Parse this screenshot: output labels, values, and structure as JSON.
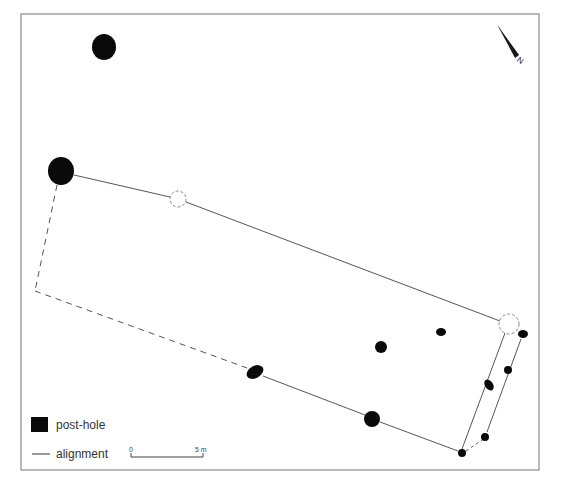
{
  "figure": {
    "type": "archaeological site plan",
    "frame": {
      "x": 21,
      "y": 14,
      "width": 518,
      "height": 456
    }
  },
  "legend": {
    "items": [
      {
        "symbol": "filled-black-square",
        "label": "post-hole"
      },
      {
        "symbol": "solid-line",
        "label": "alignment"
      }
    ]
  },
  "scale_bar": {
    "start_label": "0",
    "end_label": "5 m",
    "length_px": 68
  },
  "north_arrow": {
    "label": "N",
    "orientation_deg": -35
  },
  "colors": {
    "post_hole": "#0a0a0a",
    "alignment": "#555555",
    "frame": "#8a8a8a",
    "background": "#ffffff"
  },
  "features": {
    "post_holes": [
      {
        "id": "ph-top",
        "cx": 104,
        "cy": 47,
        "rx": 12,
        "ry": 13
      },
      {
        "id": "ph-west-corner",
        "cx": 61,
        "cy": 171,
        "rx": 13,
        "ry": 14
      },
      {
        "id": "ph-south-1",
        "cx": 255,
        "cy": 372,
        "rx": 9,
        "ry": 6,
        "rotate": -30
      },
      {
        "id": "ph-south-2",
        "cx": 372,
        "cy": 419,
        "rx": 8,
        "ry": 8
      },
      {
        "id": "ph-interior-1",
        "cx": 381,
        "cy": 347,
        "rx": 6,
        "ry": 6
      },
      {
        "id": "ph-interior-2",
        "cx": 441,
        "cy": 332,
        "rx": 5,
        "ry": 4
      },
      {
        "id": "ph-east-1",
        "cx": 523,
        "cy": 334,
        "rx": 5,
        "ry": 4
      },
      {
        "id": "ph-east-2",
        "cx": 508,
        "cy": 370,
        "rx": 4,
        "ry": 4
      },
      {
        "id": "ph-east-teardrop",
        "cx": 489,
        "cy": 385,
        "rx": 4,
        "ry": 6,
        "rotate": -35
      },
      {
        "id": "ph-east-3",
        "cx": 485,
        "cy": 437,
        "rx": 4,
        "ry": 4
      },
      {
        "id": "ph-south-east-corner",
        "cx": 462,
        "cy": 453,
        "rx": 4,
        "ry": 4
      }
    ],
    "projected_post_holes": [
      {
        "id": "ghost-north",
        "cx": 178,
        "cy": 199,
        "r": 8
      },
      {
        "id": "ghost-east",
        "cx": 509,
        "cy": 324,
        "r": 10
      }
    ],
    "alignments": [
      {
        "style": "solid",
        "points": [
          [
            74,
            175
          ],
          [
            170,
            197
          ]
        ]
      },
      {
        "style": "solid",
        "points": [
          [
            186,
            202
          ],
          [
            500,
            321
          ]
        ]
      },
      {
        "style": "dashed",
        "points": [
          [
            57,
            185
          ],
          [
            35,
            291
          ]
        ]
      },
      {
        "style": "dashed",
        "points": [
          [
            35,
            291
          ],
          [
            247,
            368
          ]
        ]
      },
      {
        "style": "solid",
        "points": [
          [
            263,
            376
          ],
          [
            365,
            415
          ]
        ]
      },
      {
        "style": "solid",
        "points": [
          [
            380,
            422
          ],
          [
            458,
            451
          ]
        ]
      },
      {
        "style": "solid",
        "points": [
          [
            505,
            333
          ],
          [
            462,
            449
          ]
        ]
      },
      {
        "style": "solid",
        "points": [
          [
            521,
            339
          ],
          [
            487,
            432
          ]
        ]
      },
      {
        "style": "dotted",
        "points": [
          [
            466,
            451
          ],
          [
            482,
            440
          ]
        ]
      }
    ]
  }
}
